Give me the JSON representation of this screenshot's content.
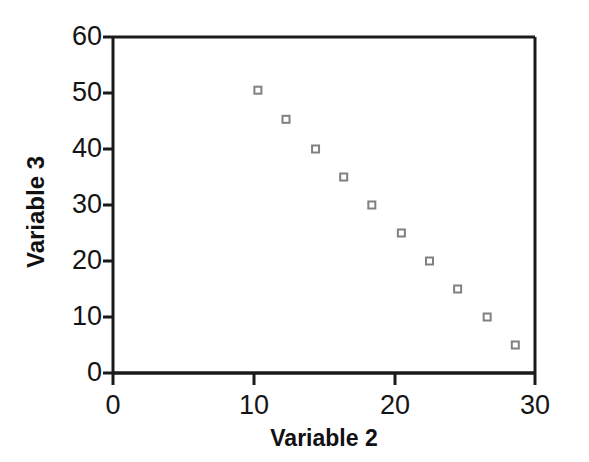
{
  "chart_data": {
    "type": "scatter",
    "title": "",
    "xlabel": "Variable 2",
    "ylabel": "Variable 3",
    "xlim": [
      0,
      30
    ],
    "ylim": [
      0,
      60
    ],
    "xticks": [
      0,
      10,
      20,
      30
    ],
    "yticks": [
      0,
      10,
      20,
      30,
      40,
      50,
      60
    ],
    "xtick_labels": [
      "0",
      "10",
      "20",
      "30"
    ],
    "ytick_labels": [
      "0",
      "10",
      "20",
      "30",
      "40",
      "50",
      "60"
    ],
    "grid": false,
    "legend": null,
    "marker": "open-square",
    "marker_color": "#808080",
    "series": [
      {
        "name": "Variable 3 vs Variable 2",
        "points": [
          {
            "x": 10.3,
            "y": 50.5
          },
          {
            "x": 12.3,
            "y": 45.3
          },
          {
            "x": 14.4,
            "y": 40.0
          },
          {
            "x": 16.4,
            "y": 35.0
          },
          {
            "x": 18.4,
            "y": 30.0
          },
          {
            "x": 20.5,
            "y": 25.0
          },
          {
            "x": 22.5,
            "y": 20.0
          },
          {
            "x": 24.5,
            "y": 15.0
          },
          {
            "x": 26.6,
            "y": 10.0
          },
          {
            "x": 28.6,
            "y": 5.0
          }
        ]
      }
    ]
  },
  "axes": {
    "frame_color": "#1a1a1a",
    "background": "#ffffff"
  }
}
